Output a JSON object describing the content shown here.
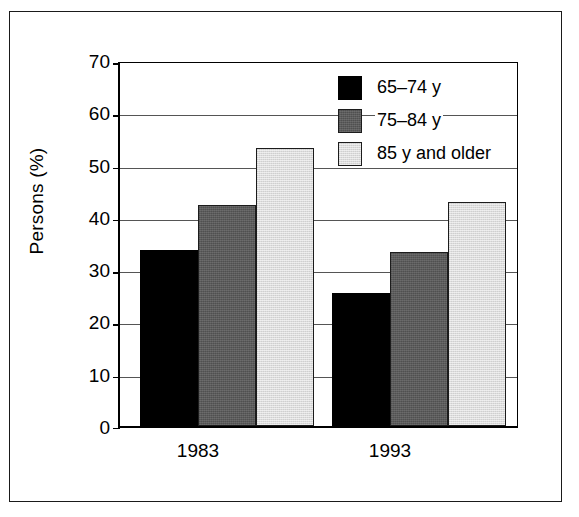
{
  "figure": {
    "background_color": "#ffffff",
    "frame_color": "#1a1a1a"
  },
  "chart_data": {
    "type": "bar",
    "title": "",
    "subtitle": "",
    "xlabel": "",
    "ylabel": "Persons (%)",
    "categories": [
      "1983",
      "1993"
    ],
    "series": [
      {
        "name": "65–74 y",
        "values": [
          34.0,
          25.6
        ],
        "color": "#000000"
      },
      {
        "name": "75–84 y",
        "values": [
          42.7,
          33.5
        ],
        "color": "#5b5b5b"
      },
      {
        "name": "85 y and older",
        "values": [
          53.7,
          43.2
        ],
        "color": "#dcdcdc"
      }
    ],
    "ylim": [
      0,
      70
    ],
    "yticks": [
      0,
      10,
      20,
      30,
      40,
      50,
      60,
      70
    ],
    "ytick_labels": [
      "0",
      "10",
      "20",
      "30",
      "40",
      "50",
      "60",
      "70"
    ],
    "grid": true,
    "grid_axis": "y",
    "legend_position": "upper right",
    "annotations": []
  },
  "axis": {
    "y_title": "Persons (%)",
    "y_tick_labels": [
      "70",
      "60",
      "50",
      "40",
      "30",
      "20",
      "10",
      "0"
    ],
    "x_tick_labels": [
      "1983",
      "1993"
    ]
  },
  "legend": {
    "entries": [
      {
        "label": "65–74 y",
        "swatch": "black-swatch"
      },
      {
        "label": "75–84 y",
        "swatch": "dark-gray-swatch"
      },
      {
        "label": "85 y and older",
        "swatch": "light-gray-swatch"
      }
    ]
  }
}
